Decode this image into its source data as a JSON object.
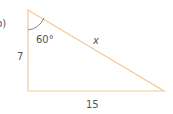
{
  "diagram": {
    "part_label": "b)",
    "angle_label": "60°",
    "side_left_label": "7",
    "hypotenuse_label": "x",
    "side_bottom_label": "15",
    "colors": {
      "triangle_stroke": "#f3c99a",
      "angle_arc": "#6b7b8c",
      "text": "#555555"
    }
  }
}
